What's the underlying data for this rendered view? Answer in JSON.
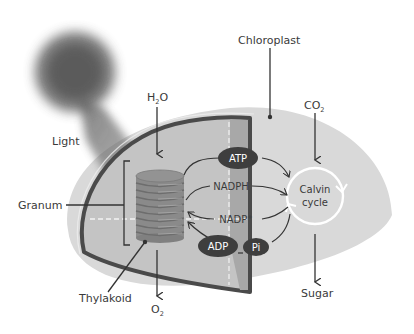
{
  "labels": {
    "light": "Light",
    "chloroplast": "Chloroplast",
    "h2o_main": "H",
    "h2o_sub": "2",
    "h2o_tail": "O",
    "co2_main": "CO",
    "co2_sub": "2",
    "o2_main": "O",
    "o2_sub": "2",
    "granum": "Granum",
    "thylakoid": "Thylakoid",
    "sugar": "Sugar",
    "atp": "ATP",
    "adp": "ADP",
    "pi": "Pi",
    "nadph": "NADPH",
    "nadp": "NADP",
    "nadp_sup": "+",
    "calvin_line1": "Calvin",
    "calvin_line2": "cycle"
  },
  "colors": {
    "chloroplast_fill": "#d9d9d9",
    "inner_fill": "#c6c6c6",
    "membrane": "#4a4a4a",
    "stroma_band": "#a9a9a9",
    "granum": "#8c8c8c",
    "ellipse": "#3e3e3e",
    "text": "#3a3a3a",
    "light_glow": "#5a5a5a"
  }
}
